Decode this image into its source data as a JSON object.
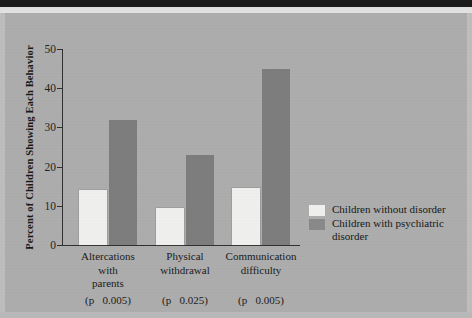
{
  "chart_data": {
    "type": "bar",
    "title": "",
    "xlabel": "",
    "ylabel": "Percent of Children Showing Each Behavior",
    "ylim": [
      0,
      50
    ],
    "yticks": [
      0,
      10,
      20,
      30,
      40,
      50
    ],
    "grid": false,
    "legend_position": "right",
    "categories": [
      "Altercations with parents",
      "Physical withdrawal",
      "Communication difficulty"
    ],
    "category_lines": [
      [
        "Altercations",
        "with",
        "parents"
      ],
      [
        "Physical",
        "withdrawal"
      ],
      [
        "Communication",
        "difficulty"
      ]
    ],
    "category_annotations": [
      "(p   0.005)",
      "(p   0.025)",
      "(p   0.005)"
    ],
    "series": [
      {
        "name": "Children without disorder",
        "color": "#f7f7f5",
        "values": [
          14,
          9.5,
          14.5
        ]
      },
      {
        "name": "Children with psychiatric disorder",
        "color": "#7d7d7d",
        "values": [
          32,
          23,
          45
        ]
      }
    ]
  },
  "legend": {
    "entries": [
      {
        "label": "Children without disorder",
        "label_line2": ""
      },
      {
        "label": "Children with psychiatric",
        "label_line2": "disorder"
      }
    ]
  },
  "axis": {
    "y_title": "Percent of Children Showing Each Behavior",
    "tick_labels": [
      "0",
      "10",
      "20",
      "30",
      "40",
      "50"
    ]
  }
}
